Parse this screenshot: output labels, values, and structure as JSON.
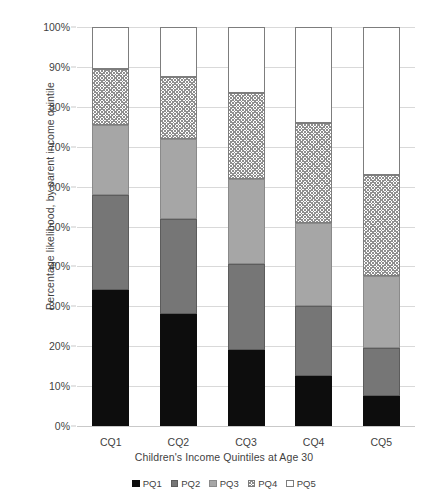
{
  "chart_data": {
    "type": "bar",
    "subtype": "stacked-bar-100percent",
    "title": "",
    "xlabel": "Children's Income Quintiles at Age 30",
    "ylabel": "Percentage likelihood, by parent income quintile",
    "categories": [
      "CQ1",
      "CQ2",
      "CQ3",
      "CQ4",
      "CQ5"
    ],
    "series": [
      {
        "name": "PQ1",
        "values": [
          34.0,
          28.0,
          19.0,
          12.5,
          7.5
        ]
      },
      {
        "name": "PQ2",
        "values": [
          24.0,
          24.0,
          21.5,
          17.5,
          12.0
        ]
      },
      {
        "name": "PQ3",
        "values": [
          17.5,
          20.0,
          21.5,
          21.0,
          18.0
        ]
      },
      {
        "name": "PQ4",
        "values": [
          14.0,
          15.5,
          21.5,
          25.0,
          25.5
        ]
      },
      {
        "name": "PQ5",
        "values": [
          10.5,
          12.5,
          16.5,
          24.0,
          37.0
        ]
      }
    ],
    "cumulative_tops": {
      "CQ1": [
        34.0,
        58.0,
        75.5,
        89.5,
        100.0
      ],
      "CQ2": [
        28.0,
        52.0,
        72.0,
        87.5,
        100.0
      ],
      "CQ3": [
        19.0,
        40.5,
        62.0,
        83.5,
        100.0
      ],
      "CQ4": [
        12.5,
        30.0,
        51.0,
        76.0,
        100.0
      ],
      "CQ5": [
        7.5,
        19.5,
        37.5,
        63.0,
        100.0
      ]
    },
    "ylim": [
      0,
      100
    ],
    "ytick_values": [
      0,
      10,
      20,
      30,
      40,
      50,
      60,
      70,
      80,
      90,
      100
    ],
    "ytick_labels": [
      "0%",
      "10%",
      "20%",
      "30%",
      "40%",
      "50%",
      "60%",
      "70%",
      "80%",
      "90%",
      "100%"
    ],
    "grid": true,
    "legend_position": "bottom",
    "legend_entries": [
      "PQ1",
      "PQ2",
      "PQ3",
      "PQ4",
      "PQ5"
    ],
    "series_colors": {
      "PQ1": "#0d0d0d",
      "PQ2": "#767676",
      "PQ3": "#a6a6a6",
      "PQ4": "#ffffff",
      "PQ5": "#ffffff"
    },
    "series_patterns": {
      "PQ1": "solid",
      "PQ2": "solid",
      "PQ3": "solid",
      "PQ4": "crosshatch",
      "PQ5": "dotted"
    }
  }
}
